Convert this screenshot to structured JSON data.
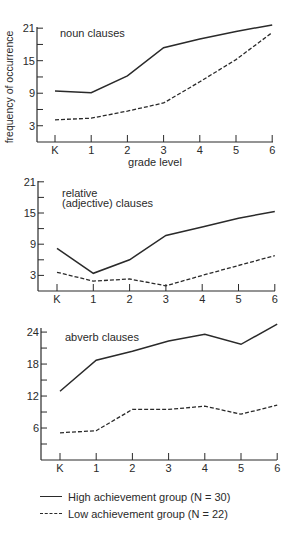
{
  "figure": {
    "ylabel": "frequency of occurrence",
    "xlabel": "grade level",
    "x_tick_labels": [
      "K",
      "1",
      "2",
      "3",
      "4",
      "5",
      "6"
    ]
  },
  "legend": {
    "items": [
      {
        "label": "High achievement group (N = 30)",
        "style": "solid"
      },
      {
        "label": "Low achievement group (N = 22)",
        "style": "dashed"
      }
    ]
  },
  "chart_data": [
    {
      "type": "line",
      "title": "noun clauses",
      "xlabel": "grade level",
      "ylabel": "frequency of occurrence",
      "categories": [
        "K",
        "1",
        "2",
        "3",
        "4",
        "5",
        "6"
      ],
      "y_ticks": [
        3,
        9,
        15,
        21
      ],
      "y_minor_ticks": [
        6,
        12,
        18
      ],
      "ylim": [
        0,
        22
      ],
      "grid": false,
      "series": [
        {
          "name": "High achievement group (N = 30)",
          "style": "solid",
          "values": [
            9.4,
            9.1,
            12.2,
            17.4,
            19.0,
            20.4,
            21.6
          ]
        },
        {
          "name": "Low achievement group (N = 22)",
          "style": "dashed",
          "values": [
            4.1,
            4.4,
            5.7,
            7.2,
            11.1,
            15.2,
            20.2
          ]
        }
      ]
    },
    {
      "type": "line",
      "title": "relative (adjective) clauses",
      "title_lines": [
        "relative",
        "(adjective) clauses"
      ],
      "xlabel": "",
      "ylabel": "",
      "categories": [
        "K",
        "1",
        "2",
        "3",
        "4",
        "5",
        "6"
      ],
      "y_ticks": [
        3,
        9,
        15,
        21
      ],
      "y_minor_ticks": [
        6,
        12,
        18
      ],
      "ylim": [
        0,
        22
      ],
      "grid": false,
      "series": [
        {
          "name": "High achievement group (N = 30)",
          "style": "solid",
          "values": [
            8.2,
            3.4,
            6.0,
            10.7,
            12.3,
            14.0,
            15.3
          ]
        },
        {
          "name": "Low achievement group (N = 22)",
          "style": "dashed",
          "values": [
            3.6,
            1.9,
            2.3,
            1.0,
            3.0,
            4.9,
            6.8
          ]
        }
      ]
    },
    {
      "type": "line",
      "title": "abverb clauses",
      "xlabel": "",
      "ylabel": "",
      "categories": [
        "K",
        "1",
        "2",
        "3",
        "4",
        "5",
        "6"
      ],
      "y_ticks": [
        6,
        12,
        18,
        24
      ],
      "y_minor_ticks": [
        3,
        9,
        15,
        21
      ],
      "ylim": [
        0,
        26
      ],
      "grid": false,
      "series": [
        {
          "name": "High achievement group (N = 30)",
          "style": "solid",
          "values": [
            12.9,
            18.7,
            20.4,
            22.3,
            23.6,
            21.7,
            25.5
          ]
        },
        {
          "name": "Low achievement group (N = 22)",
          "style": "dashed",
          "values": [
            5.1,
            5.5,
            9.5,
            9.5,
            10.1,
            8.6,
            10.3
          ]
        }
      ]
    }
  ]
}
